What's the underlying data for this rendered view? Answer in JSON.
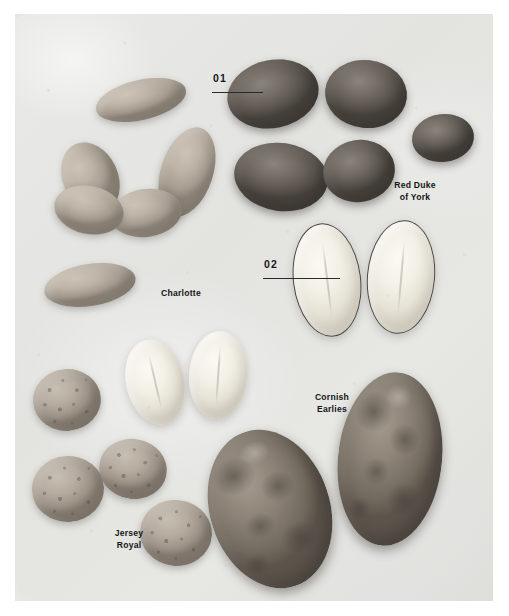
{
  "image": {
    "subject": "Potato varieties photographed on a grey concrete surface",
    "background_color": "#e5e5e2",
    "plate_margin_color": "#ffffff"
  },
  "annotations": {
    "numbered": [
      {
        "id": "01",
        "label": "01",
        "points_to": "Red Duke of York whole tuber",
        "leader_line": true
      },
      {
        "id": "02",
        "label": "02",
        "points_to": "halved potato showing cut flesh",
        "leader_line": true
      }
    ],
    "variety_labels": [
      {
        "id": "red-duke-of-york",
        "lines": [
          "Red Duke of York"
        ],
        "line1": "Red Duke",
        "line2": "of York",
        "align": "center"
      },
      {
        "id": "charlotte",
        "lines": [
          "Charlotte"
        ],
        "line1": "Charlotte",
        "line2": "",
        "align": "left"
      },
      {
        "id": "cornish-earlies",
        "lines": [
          "Cornish Earlies"
        ],
        "line1": "Cornish",
        "line2": "Earlies",
        "align": "center"
      },
      {
        "id": "jersey-royal",
        "lines": [
          "Jersey Royal"
        ],
        "line1": "Jersey",
        "line2": "Royal",
        "align": "center"
      }
    ]
  },
  "colors": {
    "label_text": "#151515",
    "leader_line": "#2a2a2a",
    "charlotte_skin": "#b6aca0",
    "red_duke_skin": "#6a645c",
    "jersey_royal_skin": "#b4aa9e",
    "cornish_earlies_skin": "#857b70",
    "cut_flesh": "#f4f1e8"
  }
}
